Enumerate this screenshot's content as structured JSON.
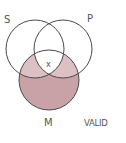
{
  "diagram": {
    "type": "venn-3",
    "circles": [
      {
        "id": "S",
        "label": "S"
      },
      {
        "id": "P",
        "label": "P"
      },
      {
        "id": "M",
        "label": "M"
      }
    ],
    "marker": "x",
    "verdict": "VALID",
    "colors": {
      "shade_light": "#dcc0c4",
      "shade_dark": "#c8a2a7",
      "stroke": "#4a4a4a"
    }
  }
}
